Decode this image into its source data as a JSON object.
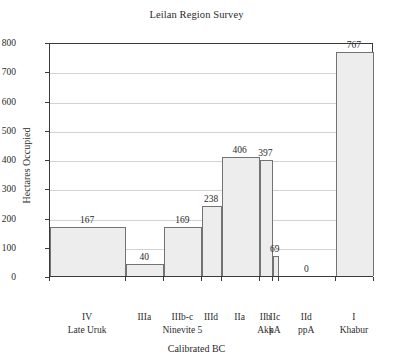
{
  "chart_data": {
    "type": "bar",
    "title": "Leilan Region Survey",
    "xlabel": "Calibrated BC",
    "ylabel": "Hectares Occupied",
    "ylim": [
      0,
      800
    ],
    "ytick_values": [
      0,
      100,
      200,
      300,
      400,
      500,
      600,
      700,
      800
    ],
    "ytick_labels": [
      "0",
      "100",
      "200",
      "300",
      "400",
      "500",
      "600",
      "700",
      "800"
    ],
    "xlim": [
      3400,
      1700
    ],
    "x_axis_direction": "reversed",
    "xtick_values": [
      3400,
      3000,
      2800,
      2600,
      2500,
      2300,
      2230,
      2200,
      1900,
      1700
    ],
    "xtick_labels": [
      "3400",
      "3000",
      "2800",
      "2600",
      "2500",
      "2300",
      "2230",
      "2200",
      "1900",
      "1700"
    ],
    "grid": "horizontal",
    "legend": "none",
    "bar_fill_color": "#ededed",
    "bar_edge_color": "#737373",
    "bars": [
      {
        "start": 3400,
        "end": 3000,
        "value": 167,
        "label": "167",
        "period": "IV",
        "period2": "Late Uruk"
      },
      {
        "start": 3000,
        "end": 2800,
        "value": 40,
        "label": "40",
        "period": "IIIa",
        "period2": ""
      },
      {
        "start": 2800,
        "end": 2600,
        "value": 169,
        "label": "169",
        "period": "IIIb-c",
        "period2": "Ninevite 5"
      },
      {
        "start": 2600,
        "end": 2500,
        "value": 238,
        "label": "238",
        "period": "IIId",
        "period2": ""
      },
      {
        "start": 2500,
        "end": 2300,
        "value": 406,
        "label": "406",
        "period": "IIa",
        "period2": ""
      },
      {
        "start": 2300,
        "end": 2230,
        "value": 397,
        "label": "397",
        "period": "IIb",
        "period2": "Akk"
      },
      {
        "start": 2230,
        "end": 2200,
        "value": 69,
        "label": "69",
        "period": "IIc",
        "period2": "pA"
      },
      {
        "start": 2200,
        "end": 1900,
        "value": 0,
        "label": "0",
        "period": "IId",
        "period2": "ppA"
      },
      {
        "start": 1900,
        "end": 1700,
        "value": 767,
        "label": "767",
        "period": "I",
        "period2": "Khabur"
      }
    ]
  }
}
